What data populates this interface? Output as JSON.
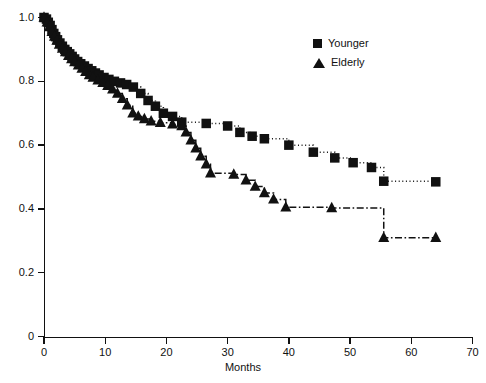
{
  "chart_data": {
    "type": "line",
    "title": "",
    "subtitle": "",
    "xlabel": "Months",
    "ylabel": "",
    "xlim": [
      0,
      70
    ],
    "ylim": [
      0,
      1.0
    ],
    "xticks": [
      0,
      10,
      20,
      30,
      40,
      50,
      60,
      70
    ],
    "yticks": [
      0,
      0.2,
      0.4,
      0.6,
      0.8,
      1.0
    ],
    "xtick_labels": [
      "0",
      "10",
      "20",
      "30",
      "40",
      "50",
      "60",
      "70"
    ],
    "ytick_labels": [
      "0",
      "0.2",
      "0.4",
      "0.6",
      "0.8",
      "1.0"
    ],
    "grid": false,
    "legend_position": "top-right",
    "curve_style": "step-post",
    "series": [
      {
        "name": "Younger",
        "marker": "square",
        "line_style": "dotted",
        "color": "#111111",
        "points": [
          [
            0.0,
            1.0
          ],
          [
            0.4,
            0.995
          ],
          [
            0.7,
            0.985
          ],
          [
            1.0,
            0.975
          ],
          [
            1.3,
            0.962
          ],
          [
            1.6,
            0.95
          ],
          [
            1.9,
            0.94
          ],
          [
            2.2,
            0.93
          ],
          [
            2.6,
            0.92
          ],
          [
            3.0,
            0.91
          ],
          [
            3.4,
            0.9
          ],
          [
            3.8,
            0.893
          ],
          [
            4.2,
            0.886
          ],
          [
            4.6,
            0.878
          ],
          [
            5.0,
            0.87
          ],
          [
            5.5,
            0.862
          ],
          [
            6.0,
            0.855
          ],
          [
            6.6,
            0.848
          ],
          [
            7.2,
            0.84
          ],
          [
            7.8,
            0.833
          ],
          [
            8.4,
            0.826
          ],
          [
            9.0,
            0.82
          ],
          [
            9.8,
            0.812
          ],
          [
            10.6,
            0.806
          ],
          [
            11.5,
            0.8
          ],
          [
            12.5,
            0.795
          ],
          [
            13.5,
            0.79
          ],
          [
            14.6,
            0.782
          ],
          [
            15.8,
            0.762
          ],
          [
            17.0,
            0.74
          ],
          [
            18.2,
            0.722
          ],
          [
            19.5,
            0.7
          ],
          [
            21.0,
            0.69
          ],
          [
            22.5,
            0.672
          ],
          [
            26.5,
            0.668
          ],
          [
            30.0,
            0.66
          ],
          [
            32.0,
            0.64
          ],
          [
            34.0,
            0.628
          ],
          [
            36.0,
            0.62
          ],
          [
            40.0,
            0.6
          ],
          [
            44.0,
            0.578
          ],
          [
            47.5,
            0.56
          ],
          [
            50.5,
            0.545
          ],
          [
            53.5,
            0.53
          ],
          [
            55.5,
            0.487
          ],
          [
            64.0,
            0.485
          ]
        ]
      },
      {
        "name": "Elderly",
        "marker": "triangle",
        "line_style": "dash-dot",
        "color": "#111111",
        "points": [
          [
            0.0,
            1.0
          ],
          [
            0.5,
            0.985
          ],
          [
            0.9,
            0.97
          ],
          [
            1.3,
            0.955
          ],
          [
            1.7,
            0.94
          ],
          [
            2.1,
            0.928
          ],
          [
            2.5,
            0.915
          ],
          [
            3.0,
            0.903
          ],
          [
            3.5,
            0.892
          ],
          [
            4.0,
            0.88
          ],
          [
            4.5,
            0.87
          ],
          [
            5.0,
            0.86
          ],
          [
            5.6,
            0.85
          ],
          [
            6.2,
            0.84
          ],
          [
            6.8,
            0.83
          ],
          [
            7.4,
            0.82
          ],
          [
            8.0,
            0.812
          ],
          [
            8.8,
            0.803
          ],
          [
            9.6,
            0.795
          ],
          [
            10.4,
            0.786
          ],
          [
            11.2,
            0.775
          ],
          [
            12.0,
            0.762
          ],
          [
            12.8,
            0.745
          ],
          [
            13.6,
            0.725
          ],
          [
            14.5,
            0.7
          ],
          [
            15.4,
            0.69
          ],
          [
            16.4,
            0.682
          ],
          [
            17.5,
            0.675
          ],
          [
            19.0,
            0.67
          ],
          [
            21.0,
            0.665
          ],
          [
            22.5,
            0.66
          ],
          [
            23.2,
            0.64
          ],
          [
            24.0,
            0.615
          ],
          [
            24.8,
            0.59
          ],
          [
            25.6,
            0.565
          ],
          [
            26.5,
            0.54
          ],
          [
            27.2,
            0.512
          ],
          [
            31.0,
            0.508
          ],
          [
            33.0,
            0.49
          ],
          [
            34.5,
            0.47
          ],
          [
            36.0,
            0.45
          ],
          [
            37.5,
            0.43
          ],
          [
            39.5,
            0.405
          ],
          [
            47.0,
            0.403
          ],
          [
            55.5,
            0.31
          ],
          [
            64.0,
            0.31
          ]
        ]
      }
    ]
  },
  "legend": {
    "items": [
      {
        "label": "Younger",
        "marker": "square"
      },
      {
        "label": "Elderly",
        "marker": "triangle"
      }
    ]
  }
}
